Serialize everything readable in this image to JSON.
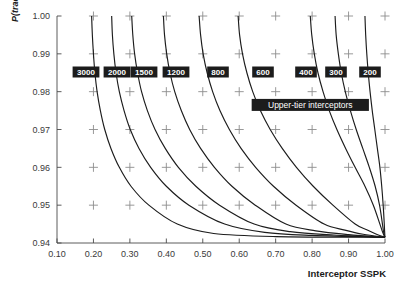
{
  "chart_data": {
    "type": "line",
    "title": "",
    "subtitle": "",
    "xlabel": "Interceptor SSPK",
    "ylabel": "P(track)",
    "xlim": [
      0.1,
      1.0
    ],
    "ylim": [
      0.94,
      1.0
    ],
    "xticks": [
      "0.10",
      "0.20",
      "0.30",
      "0.40",
      "0.50",
      "0.60",
      "0.70",
      "0.80",
      "0.90",
      "1.00"
    ],
    "xtick_values": [
      0.1,
      0.2,
      0.3,
      0.4,
      0.5,
      0.6,
      0.7,
      0.8,
      0.9,
      1.0
    ],
    "yticks": [
      "0.94",
      "0.95",
      "0.96",
      "0.97",
      "0.98",
      "0.99",
      "1.00"
    ],
    "ytick_values": [
      0.94,
      0.95,
      0.96,
      0.97,
      0.98,
      0.99,
      1.0
    ],
    "grid": "cross-markers",
    "legend_position": "inline-contour-labels",
    "annotations": [
      {
        "text": "Upper-tier interceptors",
        "x": 0.795,
        "y": 0.9765,
        "style": "white-on-black-box"
      }
    ],
    "series": [
      {
        "name": "3000",
        "label": "3000",
        "x_at_ymax": 0.195,
        "x_asymptote": 1.0,
        "y_asymptote": 0.9415,
        "points": [
          [
            0.195,
            1.0
          ],
          [
            0.197,
            0.995
          ],
          [
            0.2,
            0.99
          ],
          [
            0.204,
            0.985
          ],
          [
            0.21,
            0.98
          ],
          [
            0.219,
            0.975
          ],
          [
            0.231,
            0.97
          ],
          [
            0.248,
            0.965
          ],
          [
            0.271,
            0.96
          ],
          [
            0.303,
            0.955
          ],
          [
            0.352,
            0.95
          ],
          [
            0.43,
            0.945
          ],
          [
            0.53,
            0.9425
          ],
          [
            0.7,
            0.9417
          ],
          [
            1.0,
            0.9415
          ]
        ]
      },
      {
        "name": "2000",
        "label": "2000",
        "x_at_ymax": 0.25,
        "x_asymptote": 1.0,
        "y_asymptote": 0.9415,
        "points": [
          [
            0.25,
            1.0
          ],
          [
            0.252,
            0.995
          ],
          [
            0.256,
            0.99
          ],
          [
            0.262,
            0.985
          ],
          [
            0.271,
            0.98
          ],
          [
            0.284,
            0.975
          ],
          [
            0.301,
            0.97
          ],
          [
            0.325,
            0.965
          ],
          [
            0.357,
            0.96
          ],
          [
            0.4,
            0.955
          ],
          [
            0.462,
            0.95
          ],
          [
            0.56,
            0.945
          ],
          [
            0.67,
            0.9428
          ],
          [
            0.8,
            0.942
          ],
          [
            1.0,
            0.9415
          ]
        ]
      },
      {
        "name": "1500",
        "label": "1500",
        "x_at_ymax": 0.305,
        "x_asymptote": 1.0,
        "y_asymptote": 0.9415,
        "points": [
          [
            0.305,
            1.0
          ],
          [
            0.308,
            0.995
          ],
          [
            0.313,
            0.99
          ],
          [
            0.321,
            0.985
          ],
          [
            0.332,
            0.98
          ],
          [
            0.348,
            0.975
          ],
          [
            0.369,
            0.97
          ],
          [
            0.397,
            0.965
          ],
          [
            0.433,
            0.96
          ],
          [
            0.481,
            0.955
          ],
          [
            0.546,
            0.95
          ],
          [
            0.641,
            0.945
          ],
          [
            0.74,
            0.943
          ],
          [
            0.86,
            0.9421
          ],
          [
            1.0,
            0.9415
          ]
        ]
      },
      {
        "name": "1200",
        "label": "1200",
        "x_at_ymax": 0.392,
        "x_asymptote": 1.0,
        "y_asymptote": 0.9415,
        "points": [
          [
            0.392,
            1.0
          ],
          [
            0.395,
            0.995
          ],
          [
            0.401,
            0.99
          ],
          [
            0.41,
            0.985
          ],
          [
            0.423,
            0.98
          ],
          [
            0.441,
            0.975
          ],
          [
            0.464,
            0.97
          ],
          [
            0.494,
            0.965
          ],
          [
            0.532,
            0.96
          ],
          [
            0.58,
            0.955
          ],
          [
            0.644,
            0.95
          ],
          [
            0.728,
            0.945
          ],
          [
            0.81,
            0.9432
          ],
          [
            0.9,
            0.9422
          ],
          [
            1.0,
            0.9415
          ]
        ]
      },
      {
        "name": "800",
        "label": "800",
        "x_at_ymax": 0.49,
        "x_asymptote": 1.0,
        "y_asymptote": 0.9415,
        "points": [
          [
            0.49,
            1.0
          ],
          [
            0.494,
            0.995
          ],
          [
            0.501,
            0.99
          ],
          [
            0.512,
            0.985
          ],
          [
            0.527,
            0.98
          ],
          [
            0.547,
            0.975
          ],
          [
            0.573,
            0.97
          ],
          [
            0.605,
            0.965
          ],
          [
            0.645,
            0.96
          ],
          [
            0.694,
            0.955
          ],
          [
            0.756,
            0.95
          ],
          [
            0.833,
            0.945
          ],
          [
            0.89,
            0.9434
          ],
          [
            0.94,
            0.9423
          ],
          [
            1.0,
            0.9415
          ]
        ]
      },
      {
        "name": "600",
        "label": "600",
        "x_at_ymax": 0.597,
        "x_asymptote": 1.0,
        "y_asymptote": 0.9415,
        "points": [
          [
            0.597,
            1.0
          ],
          [
            0.601,
            0.995
          ],
          [
            0.609,
            0.99
          ],
          [
            0.621,
            0.985
          ],
          [
            0.637,
            0.98
          ],
          [
            0.658,
            0.975
          ],
          [
            0.685,
            0.97
          ],
          [
            0.718,
            0.965
          ],
          [
            0.757,
            0.96
          ],
          [
            0.803,
            0.955
          ],
          [
            0.857,
            0.95
          ],
          [
            0.918,
            0.945
          ],
          [
            0.95,
            0.9435
          ],
          [
            0.975,
            0.9424
          ],
          [
            1.0,
            0.9415
          ]
        ]
      },
      {
        "name": "400",
        "label": "400",
        "x_at_ymax": 0.795,
        "x_asymptote": 1.0,
        "y_asymptote": 0.9415,
        "points": [
          [
            0.795,
            1.0
          ],
          [
            0.799,
            0.995
          ],
          [
            0.806,
            0.99
          ],
          [
            0.816,
            0.985
          ],
          [
            0.83,
            0.98
          ],
          [
            0.847,
            0.975
          ],
          [
            0.868,
            0.97
          ],
          [
            0.892,
            0.965
          ],
          [
            0.918,
            0.96
          ],
          [
            0.945,
            0.955
          ],
          [
            0.968,
            0.95
          ],
          [
            0.986,
            0.945
          ],
          [
            0.993,
            0.943
          ],
          [
            0.997,
            0.9421
          ],
          [
            1.0,
            0.9415
          ]
        ]
      },
      {
        "name": "300",
        "label": "300",
        "x_at_ymax": 0.863,
        "x_asymptote": 1.0,
        "y_asymptote": 0.9415,
        "points": [
          [
            0.863,
            1.0
          ],
          [
            0.866,
            0.995
          ],
          [
            0.872,
            0.99
          ],
          [
            0.88,
            0.985
          ],
          [
            0.891,
            0.98
          ],
          [
            0.905,
            0.975
          ],
          [
            0.921,
            0.97
          ],
          [
            0.939,
            0.965
          ],
          [
            0.957,
            0.96
          ],
          [
            0.973,
            0.955
          ],
          [
            0.985,
            0.95
          ],
          [
            0.993,
            0.945
          ],
          [
            0.996,
            0.943
          ],
          [
            0.998,
            0.9421
          ],
          [
            1.0,
            0.9415
          ]
        ]
      },
      {
        "name": "200",
        "label": "200",
        "x_at_ymax": 0.945,
        "x_asymptote": 1.0,
        "y_asymptote": 0.9415,
        "points": [
          [
            0.945,
            1.0
          ],
          [
            0.947,
            0.995
          ],
          [
            0.95,
            0.99
          ],
          [
            0.954,
            0.985
          ],
          [
            0.959,
            0.98
          ],
          [
            0.965,
            0.975
          ],
          [
            0.972,
            0.97
          ],
          [
            0.979,
            0.965
          ],
          [
            0.986,
            0.96
          ],
          [
            0.991,
            0.955
          ],
          [
            0.995,
            0.95
          ],
          [
            0.998,
            0.945
          ],
          [
            0.999,
            0.943
          ],
          [
            0.9995,
            0.9421
          ],
          [
            1.0,
            0.9415
          ]
        ]
      }
    ],
    "contour_labels": [
      {
        "text": "3000",
        "box_x": 86,
        "box_y": 72
      },
      {
        "text": "2000",
        "box_x": 117,
        "box_y": 72
      },
      {
        "text": "1500",
        "box_x": 144,
        "box_y": 72
      },
      {
        "text": "1200",
        "box_x": 176,
        "box_y": 72
      },
      {
        "text": "800",
        "box_x": 218,
        "box_y": 72
      },
      {
        "text": "600",
        "box_x": 263,
        "box_y": 72
      },
      {
        "text": "400",
        "box_x": 306,
        "box_y": 72
      },
      {
        "text": "300",
        "box_x": 336,
        "box_y": 72
      },
      {
        "text": "200",
        "box_x": 370,
        "box_y": 72
      }
    ]
  },
  "colors": {
    "curve": "#1c1c1c",
    "frame": "#4a4a4a",
    "cross": "#8d8d8d",
    "label_box": "#1c1c1c",
    "label_text": "#ffffff",
    "tick_text": "#3a3a3a",
    "background": "#ffffff"
  }
}
